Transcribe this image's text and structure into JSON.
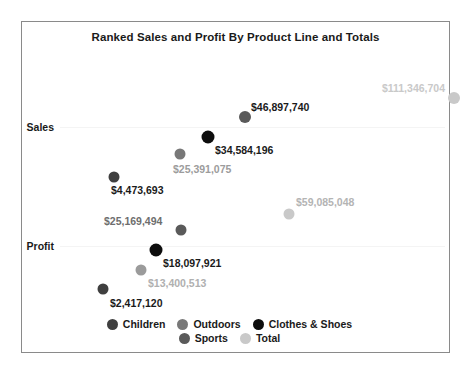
{
  "chart": {
    "title": "Ranked Sales and Profit By Product Line and Totals",
    "caption": ""
  },
  "axis": {
    "rows": [
      {
        "label": "Sales",
        "y_pct": 31.6
      },
      {
        "label": "Profit",
        "y_pct": 67.5
      }
    ]
  },
  "legend": {
    "items": [
      {
        "label": "Children",
        "color": "#3f3f3f"
      },
      {
        "label": "Outdoors",
        "color": "#787878"
      },
      {
        "label": "Clothes & Shoes",
        "color": "#0d0d0d"
      },
      {
        "label": "Sports",
        "color": "#5a5a5a"
      },
      {
        "label": "Total",
        "color": "#c9c9c9"
      }
    ]
  },
  "chart_data": {
    "type": "scatter",
    "title": "Ranked Sales and Profit By Product Line and Totals",
    "xlabel": "",
    "ylabel": "",
    "grid": true,
    "legend_position": "bottom",
    "categories": [
      "Sales",
      "Profit"
    ],
    "series": [
      {
        "name": "Children",
        "color": "#3f3f3f",
        "points": [
          {
            "row": "Sales",
            "value": 4473693,
            "label": "$4,473,693"
          },
          {
            "row": "Profit",
            "value": 2417120,
            "label": "$2,417,120"
          }
        ]
      },
      {
        "name": "Outdoors",
        "color": "#787878",
        "points": [
          {
            "row": "Sales",
            "value": 25391075,
            "label": "$25,391,075"
          },
          {
            "row": "Profit",
            "value": 13400513,
            "label": "$13,400,513"
          }
        ]
      },
      {
        "name": "Clothes & Shoes",
        "color": "#0d0d0d",
        "points": [
          {
            "row": "Sales",
            "value": 34584196,
            "label": "$34,584,196"
          },
          {
            "row": "Profit",
            "value": 18097921,
            "label": "$18,097,921"
          }
        ]
      },
      {
        "name": "Sports",
        "color": "#5a5a5a",
        "points": [
          {
            "row": "Sales",
            "value": 46897740,
            "label": "$46,897,740"
          },
          {
            "row": "Profit",
            "value": 25169494,
            "label": "$25,169,494"
          }
        ]
      },
      {
        "name": "Total",
        "color": "#c9c9c9",
        "points": [
          {
            "row": "Sales",
            "value": 111346704,
            "label": "$111,346,704"
          },
          {
            "row": "Profit",
            "value": 59085048,
            "label": "$59,085,048"
          }
        ]
      }
    ],
    "marks": [
      {
        "series": "Sports",
        "row": "Sales",
        "label": "$46,897,740",
        "color": "#5a5a5a",
        "dot_x": 223,
        "dot_y": 95,
        "size": 12,
        "lx": 229,
        "ly": 85,
        "align": "left",
        "text_color": "#1a1a1a"
      },
      {
        "series": "Total",
        "row": "Sales",
        "label": "$111,346,704",
        "color": "#c9c9c9",
        "dot_x": 432,
        "dot_y": 76,
        "size": 12,
        "lx": 425,
        "ly": 66,
        "align": "right",
        "text_color": "#c9c9c9"
      },
      {
        "series": "Clothes & Shoes",
        "row": "Sales",
        "label": "$34,584,196",
        "color": "#0d0d0d",
        "dot_x": 186,
        "dot_y": 115,
        "size": 13,
        "lx": 193,
        "ly": 128,
        "align": "left",
        "text_color": "#1a1a1a"
      },
      {
        "series": "Outdoors",
        "row": "Sales",
        "label": "$25,391,075",
        "color": "#787878",
        "dot_x": 158,
        "dot_y": 132,
        "size": 11,
        "lx": 151,
        "ly": 147,
        "align": "left",
        "text_color": "#9c9c9c"
      },
      {
        "series": "Children",
        "row": "Sales",
        "label": "$4,473,693",
        "color": "#3f3f3f",
        "dot_x": 92,
        "dot_y": 155,
        "size": 11,
        "lx": 89,
        "ly": 168,
        "align": "left",
        "text_color": "#1a1a1a"
      },
      {
        "series": "Total",
        "row": "Profit",
        "label": "$59,085,048",
        "color": "#c9c9c9",
        "dot_x": 267,
        "dot_y": 192,
        "size": 11,
        "lx": 274,
        "ly": 180,
        "align": "left",
        "text_color": "#b4b4b4"
      },
      {
        "series": "Sports",
        "row": "Profit",
        "label": "$25,169,494",
        "color": "#5a5a5a",
        "dot_x": 159,
        "dot_y": 208,
        "size": 11,
        "lx": 82,
        "ly": 199,
        "align": "left",
        "text_color": "#6e6e6e"
      },
      {
        "series": "Clothes & Shoes",
        "row": "Profit",
        "label": "$18,097,921",
        "color": "#0d0d0d",
        "dot_x": 134,
        "dot_y": 228,
        "size": 13,
        "lx": 141,
        "ly": 241,
        "align": "left",
        "text_color": "#1a1a1a"
      },
      {
        "series": "Outdoors",
        "row": "Profit",
        "label": "$13,400,513",
        "color": "#9b9b9b",
        "dot_x": 119,
        "dot_y": 248,
        "size": 11,
        "lx": 126,
        "ly": 261,
        "align": "left",
        "text_color": "#b0b0b0"
      },
      {
        "series": "Children",
        "row": "Profit",
        "label": "$2,417,120",
        "color": "#3f3f3f",
        "dot_x": 81,
        "dot_y": 267,
        "size": 11,
        "lx": 88,
        "ly": 281,
        "align": "left",
        "text_color": "#1a1a1a"
      }
    ]
  }
}
